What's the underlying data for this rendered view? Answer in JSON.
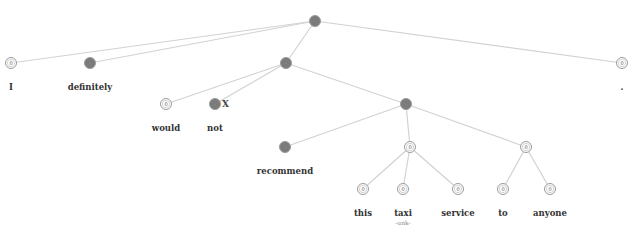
{
  "diagram": {
    "type": "sentiment-parse-tree",
    "sentence": [
      "I",
      "definitely",
      "would",
      "not",
      "recommend",
      "this",
      "taxi",
      "service",
      "to",
      "anyone",
      "."
    ],
    "colors": {
      "negative": "#7b7b7b",
      "neutral": "#ffffff",
      "edge": "#d2d2d2"
    },
    "nodes": [
      {
        "id": "root",
        "x": 315,
        "y": 21,
        "sentiment": "negative",
        "glyph": "-"
      },
      {
        "id": "I",
        "x": 11,
        "y": 63,
        "sentiment": "neutral",
        "glyph": "0",
        "word": "I"
      },
      {
        "id": "definitely",
        "x": 90,
        "y": 63,
        "sentiment": "negative",
        "glyph": "-",
        "word": "definitely"
      },
      {
        "id": "vp1",
        "x": 286,
        "y": 63,
        "sentiment": "negative",
        "glyph": "-"
      },
      {
        "id": "period",
        "x": 622,
        "y": 63,
        "sentiment": "neutral",
        "glyph": "0",
        "word": "."
      },
      {
        "id": "would",
        "x": 166,
        "y": 104,
        "sentiment": "neutral",
        "glyph": "0",
        "word": "would"
      },
      {
        "id": "not",
        "x": 215,
        "y": 104,
        "sentiment": "negative",
        "glyph": "-",
        "word": "not",
        "mark": "X"
      },
      {
        "id": "vp2",
        "x": 406,
        "y": 104,
        "sentiment": "negative",
        "glyph": "-"
      },
      {
        "id": "recommend",
        "x": 285,
        "y": 147,
        "sentiment": "negative",
        "glyph": "-",
        "word": "recommend"
      },
      {
        "id": "np",
        "x": 410,
        "y": 147,
        "sentiment": "neutral",
        "glyph": "0"
      },
      {
        "id": "pp",
        "x": 526,
        "y": 147,
        "sentiment": "neutral",
        "glyph": "0"
      },
      {
        "id": "this",
        "x": 363,
        "y": 189,
        "sentiment": "neutral",
        "glyph": "0",
        "word": "this"
      },
      {
        "id": "taxi",
        "x": 403,
        "y": 189,
        "sentiment": "neutral",
        "glyph": "0",
        "word": "taxi",
        "sub": "-unk-"
      },
      {
        "id": "service",
        "x": 458,
        "y": 189,
        "sentiment": "neutral",
        "glyph": "0",
        "word": "service"
      },
      {
        "id": "to",
        "x": 503,
        "y": 189,
        "sentiment": "neutral",
        "glyph": "0",
        "word": "to"
      },
      {
        "id": "anyone",
        "x": 550,
        "y": 189,
        "sentiment": "neutral",
        "glyph": "0",
        "word": "anyone"
      }
    ],
    "edges": [
      [
        "root",
        "I"
      ],
      [
        "root",
        "definitely"
      ],
      [
        "root",
        "vp1"
      ],
      [
        "root",
        "period"
      ],
      [
        "vp1",
        "would"
      ],
      [
        "vp1",
        "not"
      ],
      [
        "vp1",
        "vp2"
      ],
      [
        "vp2",
        "recommend"
      ],
      [
        "vp2",
        "np"
      ],
      [
        "vp2",
        "pp"
      ],
      [
        "np",
        "this"
      ],
      [
        "np",
        "taxi"
      ],
      [
        "np",
        "service"
      ],
      [
        "pp",
        "to"
      ],
      [
        "pp",
        "anyone"
      ]
    ]
  }
}
